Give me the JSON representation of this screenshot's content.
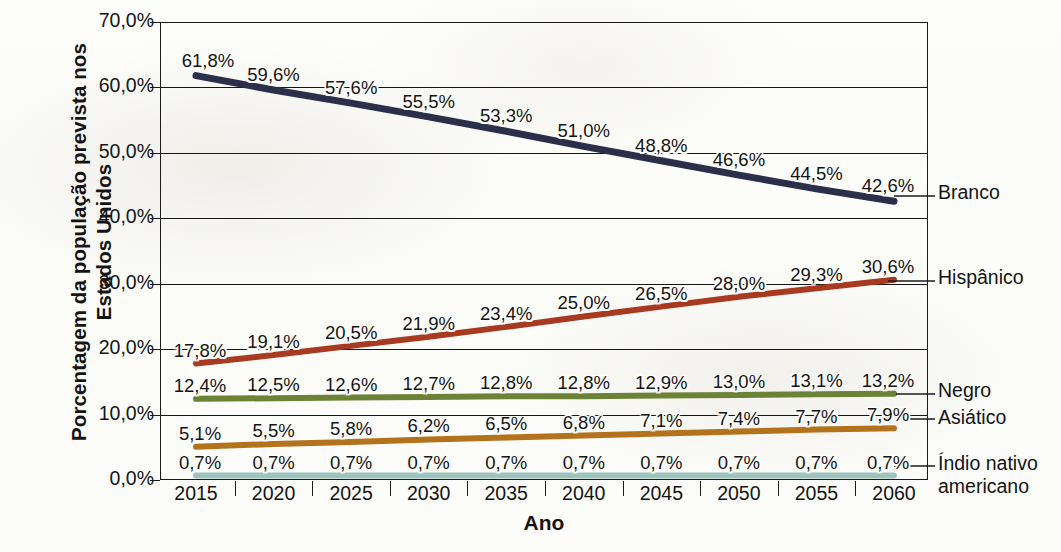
{
  "chart_data": {
    "type": "line",
    "title": "",
    "xlabel": "Ano",
    "ylabel": "Porcentagem da população\nprevista nos Estados Unidos",
    "categories": [
      "2015",
      "2020",
      "2025",
      "2030",
      "2035",
      "2040",
      "2045",
      "2050",
      "2055",
      "2060"
    ],
    "x_tick_labels": [
      "2015",
      "2020",
      "2025",
      "2030",
      "2035",
      "2040",
      "2045",
      "2050",
      "2055",
      "2060"
    ],
    "y_tick_labels": [
      "0,0%",
      "10,0%",
      "20,0%",
      "30,0%",
      "40,0%",
      "50,0%",
      "60,0%",
      "70,0%"
    ],
    "y_tick_values": [
      0,
      10,
      20,
      30,
      40,
      50,
      60,
      70
    ],
    "ylim": [
      0,
      70
    ],
    "grid": "horizontal",
    "legend_position": "right",
    "value_suffix": "%",
    "decimal_separator": ",",
    "series": [
      {
        "name": "Branco",
        "color": "#2b2f4a",
        "values": [
          61.8,
          59.6,
          57.6,
          55.5,
          53.3,
          51.0,
          48.8,
          46.6,
          44.5,
          42.6
        ],
        "labels": [
          "61,8%",
          "59,6%",
          "57,6%",
          "55,5%",
          "53,3%",
          "51,0%",
          "48,8%",
          "46,6%",
          "44,5%",
          "42,6%"
        ]
      },
      {
        "name": "Hispânico",
        "color": "#a83a22",
        "values": [
          17.8,
          19.1,
          20.5,
          21.9,
          23.4,
          25.0,
          26.5,
          28.0,
          29.3,
          30.6
        ],
        "labels": [
          "17,8%",
          "19,1%",
          "20,5%",
          "21,9%",
          "23,4%",
          "25,0%",
          "26,5%",
          "28,0%",
          "29,3%",
          "30,6%"
        ]
      },
      {
        "name": "Negro",
        "color": "#6c8337",
        "values": [
          12.4,
          12.5,
          12.6,
          12.7,
          12.8,
          12.8,
          12.9,
          13.0,
          13.1,
          13.2
        ],
        "labels": [
          "12,4%",
          "12,5%",
          "12,6%",
          "12,7%",
          "12,8%",
          "12,8%",
          "12,9%",
          "13,0%",
          "13,1%",
          "13,2%"
        ]
      },
      {
        "name": "Asiático",
        "color": "#b3721c",
        "values": [
          5.1,
          5.5,
          5.8,
          6.2,
          6.5,
          6.8,
          7.1,
          7.4,
          7.7,
          7.9
        ],
        "labels": [
          "5,1%",
          "5,5%",
          "5,8%",
          "6,2%",
          "6,5%",
          "6,8%",
          "7,1%",
          "7,4%",
          "7,7%",
          "7,9%"
        ]
      },
      {
        "name": "Índio nativo americano",
        "color": "#9cc3bc",
        "values": [
          0.7,
          0.7,
          0.7,
          0.7,
          0.7,
          0.7,
          0.7,
          0.7,
          0.7,
          0.7
        ],
        "labels": [
          "0,7%",
          "0,7%",
          "0,7%",
          "0,7%",
          "0,7%",
          "0,7%",
          "0,7%",
          "0,7%",
          "0,7%",
          "0,7%"
        ]
      }
    ]
  },
  "axes": {
    "y_title": "Porcentagem da população\nprevista nos Estados Unidos",
    "x_title": "Ano"
  },
  "legend": {
    "items": [
      {
        "label": "Branco",
        "color": "#2b2f4a"
      },
      {
        "label": "Hispânico",
        "color": "#a83a22"
      },
      {
        "label": "Negro",
        "color": "#6c8337"
      },
      {
        "label": "Asiático",
        "color": "#b3721c"
      },
      {
        "label": "Índio nativo\namericano",
        "color": "#9cc3bc"
      }
    ]
  }
}
